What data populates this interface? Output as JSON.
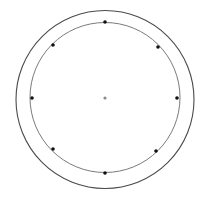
{
  "diagram": {
    "background": "#ffffff",
    "center": {
      "x": 105,
      "y": 98,
      "r": 1.6,
      "color": "#8a8a8a"
    },
    "outer_circle": {
      "cx": 105,
      "cy": 99.5,
      "r": 89,
      "stroke": "#4a4a4a",
      "stroke_width": 1.1
    },
    "inner_circle": {
      "cx": 105,
      "cy": 97.5,
      "r": 75,
      "stroke": "#7a7a7a",
      "stroke_width": 1.0
    },
    "points": [
      {
        "label": "top",
        "x": 105,
        "y": 22
      },
      {
        "label": "upper-right",
        "x": 158,
        "y": 47
      },
      {
        "label": "right",
        "x": 177,
        "y": 98
      },
      {
        "label": "lower-right",
        "x": 156,
        "y": 151
      },
      {
        "label": "bottom",
        "x": 105,
        "y": 173
      },
      {
        "label": "lower-left",
        "x": 53,
        "y": 149
      },
      {
        "label": "left",
        "x": 32,
        "y": 98
      },
      {
        "label": "upper-left",
        "x": 53,
        "y": 45
      }
    ],
    "point_radius": 1.8,
    "point_color": "#111111"
  }
}
